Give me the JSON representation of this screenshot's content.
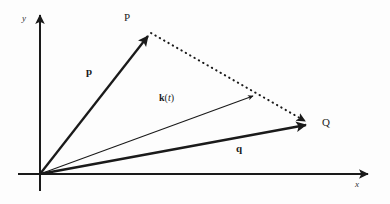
{
  "figure": {
    "background_color": "#fdfdfd",
    "stroke_color": "#1a1a1a"
  },
  "axes": {
    "x_label": "x",
    "y_label": "y",
    "origin": {
      "x": 40,
      "y": 174
    },
    "x_axis": {
      "x1": 18,
      "y1": 174,
      "x2": 372,
      "y2": 174
    },
    "y_axis": {
      "x1": 40,
      "y1": 191,
      "x2": 40,
      "y2": 11
    },
    "x_label_pos": {
      "x": 355,
      "y": 181
    },
    "y_label_pos": {
      "x": 22,
      "y": 14
    }
  },
  "points": [
    {
      "name": "P",
      "label": "P",
      "x": 151,
      "y": 33,
      "label_pos": {
        "x": 124,
        "y": 14
      }
    },
    {
      "name": "Q",
      "label": "Q",
      "x": 310,
      "y": 124,
      "label_pos": {
        "x": 322,
        "y": 118
      }
    }
  ],
  "vectors": [
    {
      "name": "p",
      "label": "p",
      "from": {
        "x": 40,
        "y": 174
      },
      "to": {
        "x": 151,
        "y": 33
      },
      "style": "solid-bold",
      "stroke_width": 2.2,
      "label_pos": {
        "x": 86,
        "y": 67
      }
    },
    {
      "name": "q",
      "label": "q",
      "from": {
        "x": 40,
        "y": 174
      },
      "to": {
        "x": 310,
        "y": 124
      },
      "style": "solid-bold",
      "stroke_width": 2.2,
      "label_pos": {
        "x": 236,
        "y": 144
      }
    },
    {
      "name": "k",
      "label_name": "k",
      "label_open": "(",
      "label_arg": "t",
      "label_close": ")",
      "from": {
        "x": 40,
        "y": 174
      },
      "to": {
        "x": 256,
        "y": 95
      },
      "style": "solid-thin",
      "stroke_width": 1.1,
      "label_pos": {
        "x": 159,
        "y": 94
      }
    }
  ],
  "dotted_segment": {
    "name": "P-to-Q",
    "from": {
      "x": 151,
      "y": 33
    },
    "to": {
      "x": 310,
      "y": 124
    },
    "style": "dotted",
    "stroke_width": 2.0,
    "dash_array": "0.5,5"
  }
}
